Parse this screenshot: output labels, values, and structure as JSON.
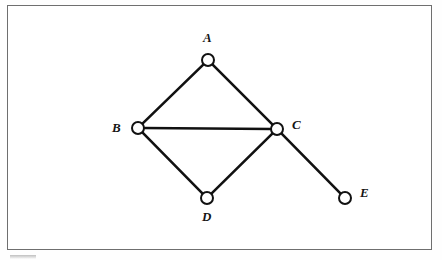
{
  "figure": {
    "type": "undirected-graph-diagram",
    "background_color": "#ffffff",
    "frame": {
      "border_color": "#6f6f6f",
      "x": 7,
      "y": 5,
      "width": 425,
      "height": 245
    },
    "node_style": {
      "radius": 6,
      "stroke_color": "#111111",
      "stroke_width": 2,
      "fill_color": "#ffffff"
    },
    "edge_style": {
      "stroke_color": "#111111",
      "stroke_width": 2.6
    }
  },
  "graph": {
    "nodes": [
      {
        "id": "A",
        "label": "A",
        "cx": 208,
        "cy": 60,
        "label_x": 203,
        "label_y": 31
      },
      {
        "id": "B",
        "label": "B",
        "cx": 138,
        "cy": 128,
        "label_x": 112,
        "label_y": 121
      },
      {
        "id": "C",
        "label": "C",
        "cx": 277,
        "cy": 129,
        "label_x": 292,
        "label_y": 118
      },
      {
        "id": "D",
        "label": "D",
        "cx": 207,
        "cy": 198,
        "label_x": 202,
        "label_y": 210
      },
      {
        "id": "E",
        "label": "E",
        "cx": 345,
        "cy": 198,
        "label_x": 360,
        "label_y": 186
      }
    ],
    "edges": [
      {
        "id": "A-B",
        "from": "A",
        "to": "B"
      },
      {
        "id": "A-C",
        "from": "A",
        "to": "C"
      },
      {
        "id": "B-C",
        "from": "B",
        "to": "C"
      },
      {
        "id": "B-D",
        "from": "B",
        "to": "D"
      },
      {
        "id": "C-D",
        "from": "C",
        "to": "D"
      },
      {
        "id": "C-E",
        "from": "C",
        "to": "E"
      }
    ]
  }
}
